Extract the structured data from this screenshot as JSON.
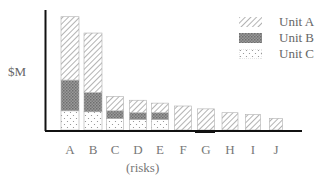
{
  "chart_data": {
    "type": "bar",
    "stacked": true,
    "title": "",
    "xlabel": "(risks)",
    "ylabel": "$M",
    "categories": [
      "A",
      "B",
      "C",
      "D",
      "E",
      "F",
      "G",
      "H",
      "I",
      "J"
    ],
    "series": [
      {
        "name": "Unit C",
        "pattern": "dots",
        "values": [
          20,
          19,
          12,
          11,
          11,
          0,
          0,
          0,
          0,
          0
        ]
      },
      {
        "name": "Unit B",
        "pattern": "crosshatch",
        "values": [
          32,
          20,
          8,
          7,
          7,
          0,
          0,
          0,
          0,
          0
        ]
      },
      {
        "name": "Unit A",
        "pattern": "diagonal",
        "values": [
          66,
          62,
          15,
          13,
          10,
          25,
          22,
          18,
          16,
          12
        ]
      }
    ],
    "totals": [
      118,
      101,
      35,
      31,
      28,
      25,
      22,
      18,
      16,
      12
    ],
    "units_note": "no numeric y ticks; values are relative heights estimated from pixels",
    "ylim": [
      0,
      125
    ],
    "grid": false,
    "legend_position": "top-right",
    "legend": [
      "Unit A",
      "Unit B",
      "Unit C"
    ]
  },
  "labels": {
    "ylabel": "$M",
    "xlabel": "(risks)",
    "legend": [
      "Unit A",
      "Unit B",
      "Unit C"
    ]
  },
  "colors": {
    "axis": "#111111",
    "pattern_stroke": "#888888",
    "crosshatch": "#777777",
    "text": "#666666"
  }
}
